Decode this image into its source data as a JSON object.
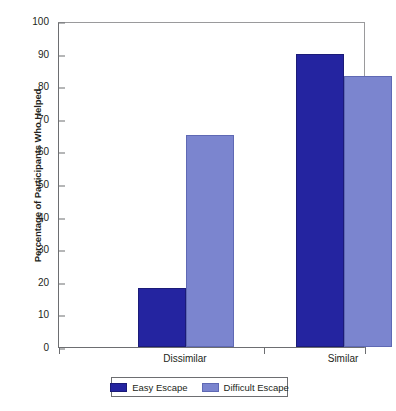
{
  "chart_data": {
    "type": "bar",
    "title": "",
    "xlabel": "",
    "ylabel": "Percentage of Participants Who Helped",
    "ylim": [
      0,
      100
    ],
    "yticks": [
      0,
      10,
      20,
      30,
      40,
      50,
      60,
      70,
      80,
      90,
      100
    ],
    "categories": [
      "Dissimilar",
      "Similar"
    ],
    "grid": false,
    "legend_position": "bottom",
    "series": [
      {
        "name": "Easy Escape",
        "color": "#2424a0",
        "values": [
          18,
          90
        ]
      },
      {
        "name": "Difficult Escape",
        "color": "#7b85cf",
        "values": [
          65,
          83
        ]
      }
    ]
  }
}
